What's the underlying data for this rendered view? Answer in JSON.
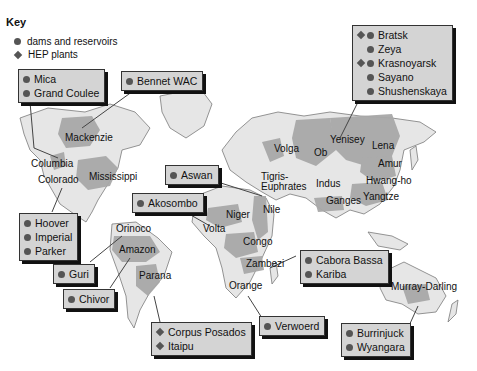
{
  "key": {
    "title": "Key",
    "items": [
      {
        "symbol": "circle",
        "label": "dams and reservoirs"
      },
      {
        "symbol": "diamond",
        "label": "HEP plants"
      }
    ]
  },
  "colors": {
    "land": "#e6e6e6",
    "basin": "#a8a8a8",
    "coast": "#7a7a7a",
    "callout_fill": "#d4d4d4",
    "marker": "#555555"
  },
  "callouts": {
    "north_america_west": {
      "items": [
        {
          "name": "Mica",
          "marks": [
            "circle"
          ]
        },
        {
          "name": "Grand Coulee",
          "marks": [
            "circle"
          ]
        }
      ]
    },
    "bennet": {
      "items": [
        {
          "name": "Bennet WAC",
          "marks": [
            "circle"
          ]
        }
      ]
    },
    "siberia": {
      "items": [
        {
          "name": "Bratsk",
          "marks": [
            "diamond",
            "circle"
          ]
        },
        {
          "name": "Zeya",
          "marks": [
            "circle"
          ]
        },
        {
          "name": "Krasnoyarsk",
          "marks": [
            "diamond",
            "circle"
          ]
        },
        {
          "name": "Sayano",
          "marks": [
            "circle"
          ]
        },
        {
          "name": "Shushenskaya",
          "marks": [
            "circle"
          ]
        }
      ]
    },
    "aswan": {
      "items": [
        {
          "name": "Aswan",
          "marks": [
            "circle"
          ]
        }
      ]
    },
    "akosombo": {
      "items": [
        {
          "name": "Akosombo",
          "marks": [
            "circle"
          ]
        }
      ]
    },
    "colorado": {
      "items": [
        {
          "name": "Hoover",
          "marks": [
            "circle"
          ]
        },
        {
          "name": "Imperial",
          "marks": [
            "circle"
          ]
        },
        {
          "name": "Parker",
          "marks": [
            "circle"
          ]
        }
      ]
    },
    "guri": {
      "items": [
        {
          "name": "Guri",
          "marks": [
            "circle"
          ]
        }
      ]
    },
    "chivor": {
      "items": [
        {
          "name": "Chivor",
          "marks": [
            "circle"
          ]
        }
      ]
    },
    "parana": {
      "items": [
        {
          "name": "Corpus Posados",
          "marks": [
            "diamond"
          ]
        },
        {
          "name": "Itaipu",
          "marks": [
            "diamond"
          ]
        }
      ]
    },
    "verwoerd": {
      "items": [
        {
          "name": "Verwoerd",
          "marks": [
            "circle"
          ]
        }
      ]
    },
    "zambezi": {
      "items": [
        {
          "name": "Cabora Bassa",
          "marks": [
            "circle"
          ]
        },
        {
          "name": "Kariba",
          "marks": [
            "circle"
          ]
        }
      ]
    },
    "murray": {
      "items": [
        {
          "name": "Burrinjuck",
          "marks": [
            "circle"
          ]
        },
        {
          "name": "Wyangara",
          "marks": [
            "circle"
          ]
        }
      ]
    }
  },
  "rivers": [
    {
      "name": "Mackenzie",
      "x": 65,
      "y": 139
    },
    {
      "name": "Columbia",
      "x": 31,
      "y": 164
    },
    {
      "name": "Colorado",
      "x": 38,
      "y": 180
    },
    {
      "name": "Mississippi",
      "x": 89,
      "y": 177
    },
    {
      "name": "Orinoco",
      "x": 116,
      "y": 229
    },
    {
      "name": "Amazon",
      "x": 119,
      "y": 250
    },
    {
      "name": "Parana",
      "x": 139,
      "y": 276
    },
    {
      "name": "Volga",
      "x": 274,
      "y": 149
    },
    {
      "name": "Ob",
      "x": 314,
      "y": 153
    },
    {
      "name": "Yenisey",
      "x": 330,
      "y": 140
    },
    {
      "name": "Lena",
      "x": 372,
      "y": 146
    },
    {
      "name": "Amur",
      "x": 378,
      "y": 164
    },
    {
      "name": "Tigris-",
      "x": 261,
      "y": 177
    },
    {
      "name": "Euphrates",
      "x": 261,
      "y": 187
    },
    {
      "name": "Indus",
      "x": 316,
      "y": 184
    },
    {
      "name": "Hwang-ho",
      "x": 366,
      "y": 181
    },
    {
      "name": "Yangtze",
      "x": 363,
      "y": 197
    },
    {
      "name": "Ganges",
      "x": 326,
      "y": 201
    },
    {
      "name": "Nile",
      "x": 263,
      "y": 210
    },
    {
      "name": "Niger",
      "x": 226,
      "y": 215
    },
    {
      "name": "Volta",
      "x": 203,
      "y": 229
    },
    {
      "name": "Congo",
      "x": 243,
      "y": 242
    },
    {
      "name": "Zambezi",
      "x": 246,
      "y": 264
    },
    {
      "name": "Orange",
      "x": 229,
      "y": 286
    },
    {
      "name": "Murray-Darling",
      "x": 391,
      "y": 287
    }
  ]
}
